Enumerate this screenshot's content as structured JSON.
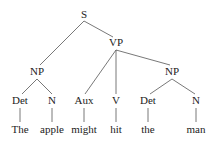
{
  "tree": {
    "nodes": {
      "s": {
        "label": "S",
        "x": 84,
        "y": 18
      },
      "vp": {
        "label": "VP",
        "x": 116,
        "y": 46
      },
      "np1": {
        "label": "NP",
        "x": 37,
        "y": 75
      },
      "np2": {
        "label": "NP",
        "x": 172,
        "y": 75
      },
      "det1": {
        "label": "Det",
        "x": 20,
        "y": 104
      },
      "n1": {
        "label": "N",
        "x": 52,
        "y": 104
      },
      "aux": {
        "label": "Aux",
        "x": 84,
        "y": 104
      },
      "v": {
        "label": "V",
        "x": 116,
        "y": 104
      },
      "det2": {
        "label": "Det",
        "x": 148,
        "y": 104
      },
      "n2": {
        "label": "N",
        "x": 196,
        "y": 104
      },
      "w1": {
        "label": "The",
        "x": 20,
        "y": 133
      },
      "w2": {
        "label": "apple",
        "x": 52,
        "y": 133
      },
      "w3": {
        "label": "might",
        "x": 84,
        "y": 133
      },
      "w4": {
        "label": "hit",
        "x": 116,
        "y": 133
      },
      "w5": {
        "label": "the",
        "x": 148,
        "y": 133
      },
      "w6": {
        "label": "man",
        "x": 196,
        "y": 133
      }
    },
    "sentence": "The apple might hit the man"
  }
}
